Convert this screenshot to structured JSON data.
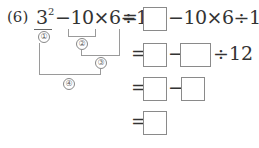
{
  "problem": {
    "label": "(6)",
    "base": "3",
    "exponent": "2",
    "expr_rest": "−10×6÷12",
    "steps": [
      {
        "eq": "=",
        "after_box1": "−10×6÷12"
      },
      {
        "eq": "=",
        "op1": "−",
        "after_box2": "÷12"
      },
      {
        "eq": "=",
        "op1": "−"
      },
      {
        "eq": "="
      }
    ],
    "bracket_labels": [
      "①",
      "②",
      "③",
      "④"
    ]
  }
}
